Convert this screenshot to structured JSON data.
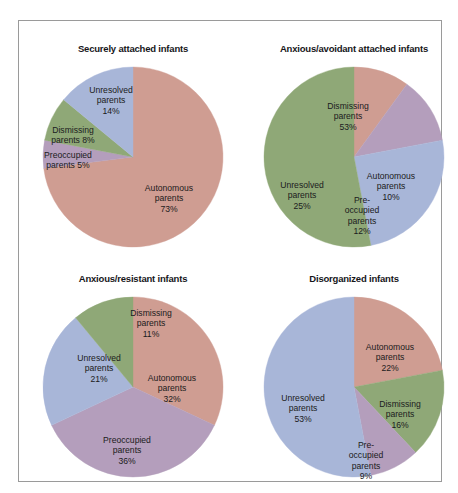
{
  "figure": {
    "background": "#ffffff",
    "border_color": "#9a9a9a"
  },
  "palette": {
    "autonomous": "#cf9d92",
    "dismissing": "#8fa877",
    "preoccupied": "#b49ebc",
    "unresolved": "#a8b6d8",
    "label_text": "#1b1b20",
    "title_text": "#16161a"
  },
  "chart_data": {
    "type": "pie",
    "title": "",
    "legend": "none",
    "charts": [
      {
        "title": "Securely attached infants",
        "categories": [
          "Autonomous parents",
          "Preoccupied parents",
          "Dismissing parents",
          "Unresolved parents"
        ],
        "values": [
          73,
          5,
          8,
          14
        ],
        "slices": [
          {
            "name": "Autonomous parents",
            "value": 73,
            "label_lines": [
              "Autonomous",
              "parents"
            ],
            "pct_label": "73%",
            "color": "#cf9d92",
            "label_x": 142,
            "label_y": 140
          },
          {
            "name": "Preoccupied parents",
            "value": 5,
            "label_lines": [
              "Preoccupied"
            ],
            "pct_label": "parents  5%",
            "color": "#b49ebc",
            "label_x": 41,
            "label_y": 101
          },
          {
            "name": "Dismissing parents",
            "value": 8,
            "label_lines": [
              "Dismissing"
            ],
            "pct_label": "parents  8%",
            "color": "#8fa877",
            "label_x": 46,
            "label_y": 76
          },
          {
            "name": "Unresolved parents",
            "value": 14,
            "label_lines": [
              "Unresolved",
              "parents"
            ],
            "pct_label": "14%",
            "color": "#a8b6d8",
            "label_x": 84,
            "label_y": 42
          }
        ]
      },
      {
        "title": "Anxious/avoidant attached infants",
        "categories": [
          "Autonomous parents",
          "Preoccupied parents",
          "Unresolved parents",
          "Dismissing parents"
        ],
        "values": [
          10,
          12,
          25,
          53
        ],
        "slices": [
          {
            "name": "Autonomous parents",
            "value": 10,
            "label_lines": [
              "Autonomous",
              "parents"
            ],
            "pct_label": "10%",
            "color": "#cf9d92",
            "label_x": 143,
            "label_y": 128
          },
          {
            "name": "Preoccupied parents",
            "value": 12,
            "label_lines": [
              "Pre-",
              "occupied",
              "parents"
            ],
            "pct_label": "12%",
            "color": "#b49ebc",
            "label_x": 114,
            "label_y": 157
          },
          {
            "name": "Unresolved parents",
            "value": 25,
            "label_lines": [
              "Unresolved",
              "parents"
            ],
            "pct_label": "25%",
            "color": "#a8b6d8",
            "label_x": 54,
            "label_y": 137
          },
          {
            "name": "Dismissing parents",
            "value": 53,
            "label_lines": [
              "Dismissing",
              "parents"
            ],
            "pct_label": "53%",
            "color": "#8fa877",
            "label_x": 100,
            "label_y": 58
          }
        ]
      },
      {
        "title": "Anxious/resistant infants",
        "categories": [
          "Autonomous parents",
          "Preoccupied parents",
          "Unresolved parents",
          "Dismissing parents"
        ],
        "values": [
          32,
          36,
          21,
          11
        ],
        "slices": [
          {
            "name": "Autonomous parents",
            "value": 32,
            "label_lines": [
              "Autonomous",
              "parents"
            ],
            "pct_label": "32%",
            "color": "#cf9d92",
            "label_x": 145,
            "label_y": 100
          },
          {
            "name": "Preoccupied parents",
            "value": 36,
            "label_lines": [
              "Preoccupied",
              "parents"
            ],
            "pct_label": "36%",
            "color": "#b49ebc",
            "label_x": 100,
            "label_y": 162
          },
          {
            "name": "Unresolved parents",
            "value": 21,
            "label_lines": [
              "Unresolved",
              "parents"
            ],
            "pct_label": "21%",
            "color": "#a8b6d8",
            "label_x": 72,
            "label_y": 80
          },
          {
            "name": "Dismissing parents",
            "value": 11,
            "label_lines": [
              "Dismissing",
              "parents"
            ],
            "pct_label": "11%",
            "color": "#8fa877",
            "label_x": 124,
            "label_y": 35
          }
        ]
      },
      {
        "title": "Disorganized infants",
        "categories": [
          "Autonomous parents",
          "Dismissing parents",
          "Preoccupied parents",
          "Unresolved parents"
        ],
        "values": [
          22,
          16,
          9,
          53
        ],
        "slices": [
          {
            "name": "Autonomous parents",
            "value": 22,
            "label_lines": [
              "Autonomous",
              "parents"
            ],
            "pct_label": "22%",
            "color": "#cf9d92",
            "label_x": 142,
            "label_y": 69
          },
          {
            "name": "Dismissing parents",
            "value": 16,
            "label_lines": [
              "Dismissing",
              "parents"
            ],
            "pct_label": "16%",
            "color": "#8fa877",
            "label_x": 152,
            "label_y": 126
          },
          {
            "name": "Preoccupied parents",
            "value": 9,
            "label_lines": [
              "Pre-",
              "occupied",
              "parents"
            ],
            "pct_label": "9%",
            "color": "#b49ebc",
            "label_x": 118,
            "label_y": 172
          },
          {
            "name": "Unresolved parents",
            "value": 53,
            "label_lines": [
              "Unresolved",
              "parents"
            ],
            "pct_label": "53%",
            "color": "#a8b6d8",
            "label_x": 55,
            "label_y": 120
          }
        ]
      }
    ]
  }
}
